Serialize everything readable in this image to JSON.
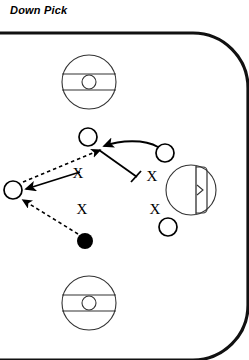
{
  "diagram": {
    "title": "Down Pick",
    "type": "ice-hockey-play-diagram",
    "colors": {
      "ink": "#000000",
      "rink_border": "#111111",
      "ice": "#ffffff",
      "marking": "#333333"
    },
    "rink": {
      "open_side": "left",
      "border_width": 3,
      "corner_radius": 55,
      "boundary_note": "top, right and bottom boards drawn; left edge open (cropped)"
    },
    "faceoff_circles": [
      {
        "name": "faceoff-circle-top",
        "cx": 89,
        "cy": 82,
        "r": 27,
        "center_dot_r": 7,
        "hash_offsets": [
          -8,
          8
        ]
      },
      {
        "name": "faceoff-circle-bottom",
        "cx": 89,
        "cy": 303,
        "r": 27,
        "center_dot_r": 7,
        "hash_offsets": [
          -8,
          8
        ]
      }
    ],
    "goal": {
      "name": "goal-crease",
      "crease_cx": 191,
      "crease_cy": 190,
      "crease_r": 25,
      "goal_line_x": 196,
      "net_label": "net"
    },
    "players": {
      "offense_symbol": "O",
      "defense_symbol": "X",
      "puck_symbol": "filled-circle",
      "offense": [
        {
          "name": "player-o-left",
          "cx": 13,
          "cy": 190,
          "r": 9
        },
        {
          "name": "player-o-top",
          "cx": 88,
          "cy": 137,
          "r": 9
        },
        {
          "name": "player-o-right",
          "cx": 165,
          "cy": 153,
          "r": 9
        },
        {
          "name": "player-o-bottom-right",
          "cx": 168,
          "cy": 227,
          "r": 9
        }
      ],
      "defense": [
        {
          "name": "player-x-upper-left",
          "x": 78,
          "y": 178,
          "label": "X"
        },
        {
          "name": "player-x-lower-left",
          "x": 82,
          "y": 214,
          "label": "X"
        },
        {
          "name": "player-x-upper-right",
          "x": 152,
          "y": 181,
          "label": "X"
        },
        {
          "name": "player-x-lower-right",
          "x": 155,
          "y": 214,
          "label": "X"
        }
      ],
      "puck": {
        "name": "puck",
        "cx": 85,
        "cy": 241,
        "r": 8
      }
    },
    "movements": [
      {
        "name": "pass-puck-to-o-left",
        "style": "dashed",
        "arrow": true,
        "from": [
          78,
          234
        ],
        "to": [
          22,
          199
        ],
        "meaning": "puck pass"
      },
      {
        "name": "skate-x-to-o-left",
        "style": "solid",
        "arrow": true,
        "from": [
          78,
          172
        ],
        "to": [
          24,
          190
        ],
        "meaning": "player movement"
      },
      {
        "name": "pass-to-o-top",
        "style": "dashed",
        "arrow": true,
        "from": [
          24,
          183
        ],
        "to": [
          100,
          150
        ],
        "meaning": "puck pass"
      },
      {
        "name": "skate-o-right-to-top",
        "style": "solid-curve",
        "arrow": true,
        "from": [
          158,
          148
        ],
        "to": [
          101,
          147
        ],
        "meaning": "player movement"
      },
      {
        "name": "down-pick-block",
        "style": "solid-with-tick",
        "arrow": false,
        "from": [
          99,
          151
        ],
        "to": [
          136,
          176
        ],
        "meaning": "pick / screen set"
      }
    ],
    "legend_note": "O = offense, X = defense, filled circle = puck"
  }
}
